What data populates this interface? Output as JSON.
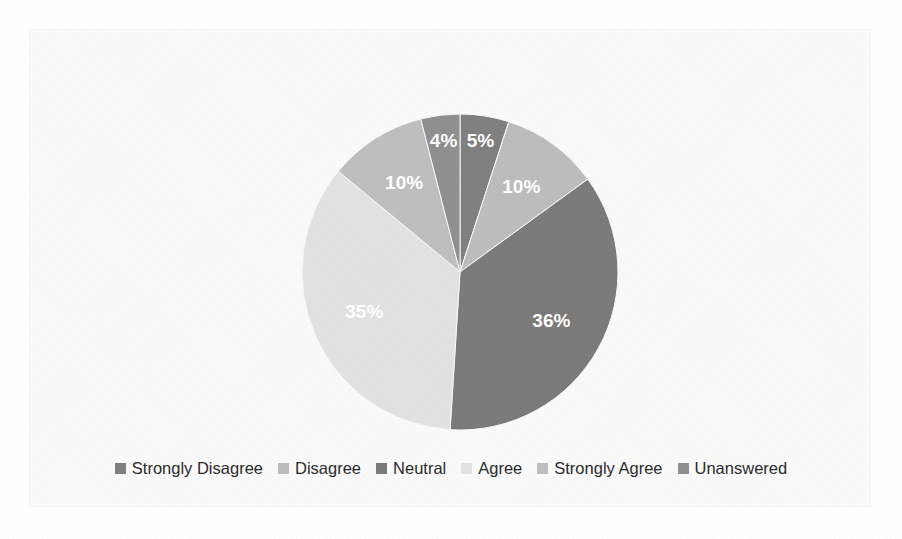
{
  "chart_data": {
    "type": "pie",
    "title": "",
    "legend_position": "bottom",
    "categories": [
      "Strongly Disagree",
      "Disagree",
      "Neutral",
      "Agree",
      "Strongly Agree",
      "Unanswered"
    ],
    "values": [
      5,
      10,
      36,
      35,
      10,
      4
    ],
    "labels": [
      "5%",
      "10%",
      "36%",
      "35%",
      "10%",
      "4%"
    ],
    "units": "percent",
    "start_angle_deg": 0,
    "direction": "clockwise",
    "colors": [
      "#808080",
      "#bdbdbd",
      "#7b7b7b",
      "#e2e2e2",
      "#bfbfbf",
      "#909090"
    ],
    "label_color": "#ffffff",
    "background": "#fafafa"
  },
  "legend": {
    "items": [
      {
        "label": "Strongly Disagree",
        "color": "#808080"
      },
      {
        "label": "Disagree",
        "color": "#bdbdbd"
      },
      {
        "label": "Neutral",
        "color": "#7b7b7b"
      },
      {
        "label": "Agree",
        "color": "#e2e2e2"
      },
      {
        "label": "Strongly Agree",
        "color": "#bfbfbf"
      },
      {
        "label": "Unanswered",
        "color": "#909090"
      }
    ]
  }
}
